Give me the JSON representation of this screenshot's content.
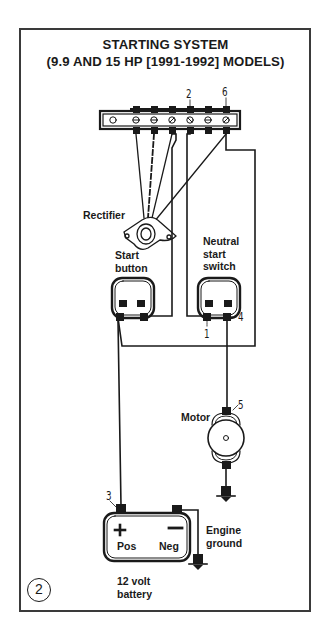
{
  "figure": {
    "title_line1": "STARTING SYSTEM",
    "title_line2": "(9.9 AND 15 HP [1991-1992] MODELS)",
    "figure_number": "2"
  },
  "labels": {
    "rectifier": "Rectifier",
    "start_button": [
      "Start",
      "button"
    ],
    "neutral_start_switch": [
      "Neutral",
      "start",
      "switch"
    ],
    "motor": "Motor",
    "engine_ground": [
      "Engine",
      "ground"
    ],
    "battery": [
      "12 volt",
      "battery"
    ],
    "battery_pos": "Pos",
    "battery_neg": "Neg",
    "battery_plus_symbol": "+",
    "battery_minus_symbol": "—"
  },
  "callouts": {
    "c1": "1",
    "c2": "2",
    "c3": "3",
    "c4": "4",
    "c5": "5",
    "c6": "6"
  },
  "components": [
    {
      "id": "terminal-strip",
      "terminals": 7
    },
    {
      "id": "rectifier"
    },
    {
      "id": "start-button"
    },
    {
      "id": "neutral-start-switch"
    },
    {
      "id": "starter-motor"
    },
    {
      "id": "battery"
    },
    {
      "id": "engine-ground"
    }
  ],
  "colors": {
    "ink": "#1a1a1a",
    "frame": "#3a3a3a",
    "background": "#ffffff"
  }
}
